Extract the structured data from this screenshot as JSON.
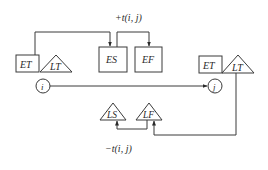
{
  "diagram": {
    "type": "CPM activity time-parameter diagram",
    "colors": {
      "stroke": "#3a3a3a",
      "text": "#2a2a2a",
      "background": "#ffffff"
    },
    "start_node": {
      "label": "i",
      "et_label": "ET",
      "lt_label": "LT"
    },
    "end_node": {
      "label": "j",
      "et_label": "ET",
      "lt_label": "LT"
    },
    "activity": {
      "es_label": "ES",
      "ef_label": "EF",
      "ls_label": "LS",
      "lf_label": "LF"
    },
    "annotations": {
      "forward": "+t(i,  j)",
      "backward": "−t(i,  j)"
    },
    "edges": [
      {
        "from": "start_node.ET",
        "to": "activity.ES"
      },
      {
        "from": "activity.ES",
        "to": "activity.EF",
        "label": "+t(i, j)"
      },
      {
        "from": "start_node.i",
        "to": "end_node.j"
      },
      {
        "from": "end_node.LT",
        "to": "activity.LF"
      },
      {
        "from": "activity.LF",
        "to": "activity.LS",
        "label": "−t(i, j)"
      }
    ]
  }
}
